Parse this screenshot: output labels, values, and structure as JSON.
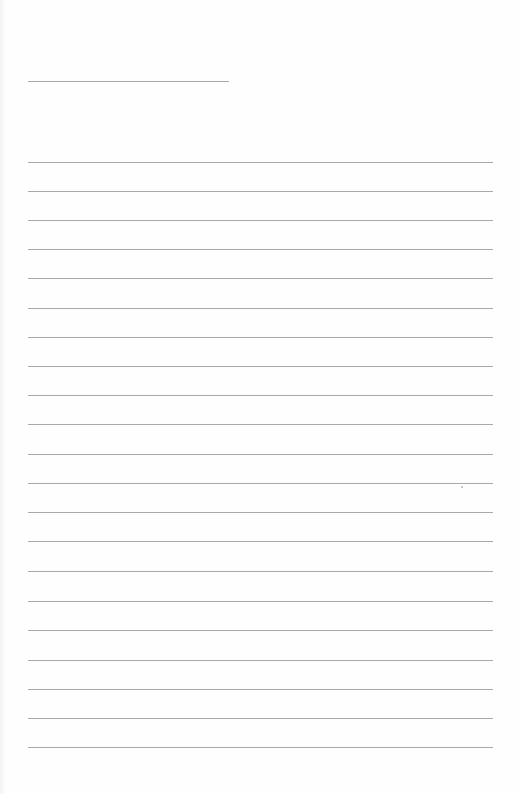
{
  "document": {
    "type": "lined-paper",
    "header_line": {
      "x1": 28,
      "x2": 229,
      "y": 81
    },
    "ruled_lines": {
      "x1": 28,
      "x2": 493,
      "y_positions": [
        162,
        191,
        220,
        249,
        278,
        308,
        337,
        366,
        395,
        424,
        454,
        483,
        512,
        541,
        571,
        601,
        630,
        660,
        689,
        718,
        747
      ]
    },
    "line_color": "#a9a9a9",
    "background_color": "#fefefe",
    "specks": [
      {
        "x": 461,
        "y": 486
      }
    ]
  }
}
